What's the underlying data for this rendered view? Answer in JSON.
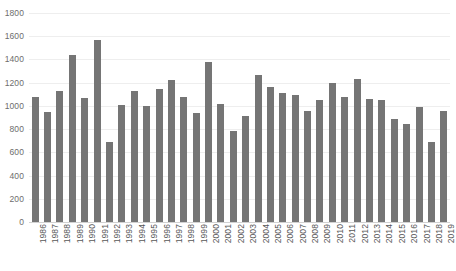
{
  "chart_data": {
    "type": "bar",
    "title": "",
    "subtitle": "",
    "xlabel": "",
    "ylabel": "",
    "ylim": [
      0,
      1800
    ],
    "y_ticks": [
      0,
      200,
      400,
      600,
      800,
      1000,
      1200,
      1400,
      1600,
      1800
    ],
    "grid": true,
    "legend": "none",
    "bar_color": "#757575",
    "gridline_color": "#eeeeee",
    "axis_text_color": "#595959",
    "categories": [
      "1986",
      "1987",
      "1988",
      "1989",
      "1990",
      "1991",
      "1992",
      "1993",
      "1994",
      "1995",
      "1996",
      "1997",
      "1998",
      "1999",
      "2000",
      "2001",
      "2002",
      "2003",
      "2004",
      "2005",
      "2006",
      "2007",
      "2008",
      "2009",
      "2010",
      "2011",
      "2012",
      "2013",
      "2014",
      "2015",
      "2016",
      "2017",
      "2018",
      "2019"
    ],
    "values": [
      1080,
      950,
      1130,
      1435,
      1065,
      1570,
      685,
      1010,
      1130,
      1000,
      1145,
      1225,
      1080,
      935,
      1375,
      1020,
      785,
      910,
      1270,
      1165,
      1110,
      1090,
      960,
      1050,
      1195,
      1080,
      1230,
      1060,
      1055,
      890,
      840,
      990,
      690,
      960
    ]
  }
}
